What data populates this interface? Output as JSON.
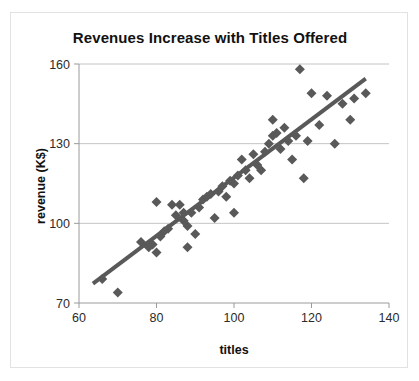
{
  "chart_data": {
    "type": "scatter",
    "title": "Revenues Increase with Titles Offered",
    "xlabel": "titles",
    "ylabel": "revenue (K$)",
    "xlim": [
      60,
      140
    ],
    "ylim": [
      70,
      160
    ],
    "xticks": [
      "60",
      "80",
      "100",
      "120",
      "140"
    ],
    "yticks": [
      "70",
      "100",
      "130",
      "160"
    ],
    "xtick_values": [
      60,
      80,
      100,
      120,
      140
    ],
    "ytick_values": [
      70,
      100,
      130,
      160
    ],
    "grid": "horizontal",
    "legend": "none",
    "marker": "diamond",
    "marker_color": "#595959",
    "trendline_color": "#595959",
    "series": [
      {
        "name": "stores",
        "x": [
          66,
          70,
          76,
          78,
          79,
          80,
          80,
          81,
          82,
          83,
          84,
          85,
          86,
          87,
          87,
          88,
          88,
          89,
          90,
          91,
          92,
          93,
          94,
          95,
          96,
          97,
          98,
          99,
          100,
          100,
          101,
          102,
          103,
          104,
          105,
          106,
          107,
          108,
          109,
          110,
          110,
          111,
          112,
          113,
          114,
          115,
          116,
          117,
          118,
          119,
          120,
          122,
          124,
          126,
          128,
          130,
          131,
          134
        ],
        "y": [
          79,
          74,
          93,
          91,
          92,
          89,
          108,
          95,
          97,
          98,
          107,
          103,
          107,
          101,
          104,
          99,
          91,
          104,
          96,
          106,
          109,
          110,
          111,
          102,
          112,
          114,
          110,
          116,
          115,
          104,
          118,
          124,
          120,
          117,
          126,
          122,
          120,
          127,
          130,
          139,
          133,
          134,
          128,
          136,
          131,
          124,
          133,
          158,
          117,
          131,
          149,
          137,
          148,
          130,
          145,
          139,
          147,
          149
        ]
      }
    ],
    "trendline": {
      "name": "linear-fit",
      "x_start": 63.6,
      "y_start": 77.3,
      "x_end": 134.0,
      "y_end": 154.5
    }
  }
}
